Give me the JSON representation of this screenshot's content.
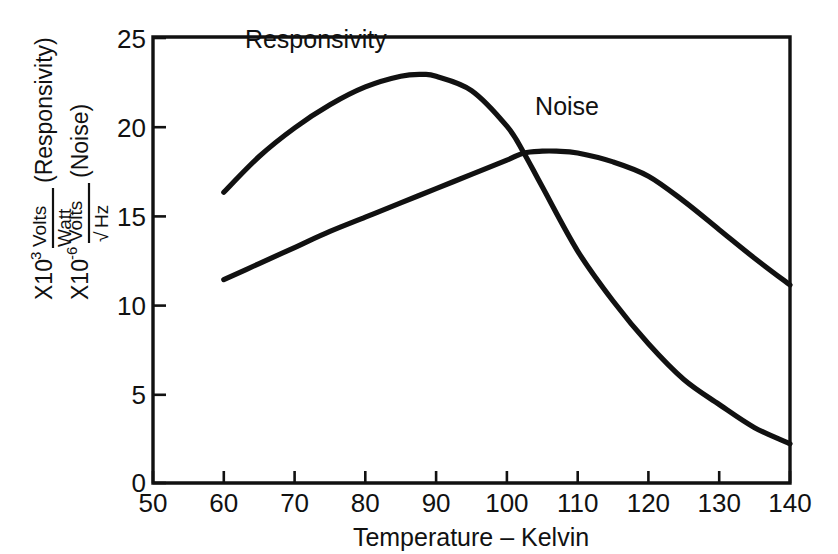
{
  "chart_data": {
    "type": "line",
    "title": "",
    "xlabel": "Temperature – Kelvin",
    "ylabel_line1": "X10³ Volts/Watt (Responsivity)",
    "ylabel_line2": "X10⁻⁶ Volts/√Hz (Noise)",
    "xlim": [
      50,
      140
    ],
    "ylim": [
      0,
      25
    ],
    "xticks": [
      50,
      60,
      70,
      80,
      90,
      100,
      110,
      120,
      130,
      140
    ],
    "yticks": [
      0,
      5,
      10,
      15,
      20,
      25
    ],
    "grid": false,
    "legend_position": "inline-annotations",
    "series": [
      {
        "name": "Responsivity",
        "units": "X10^3 Volts/Watt",
        "x": [
          60,
          65,
          70,
          75,
          80,
          85,
          88,
          90,
          95,
          100,
          102.4,
          105,
          110,
          115,
          120,
          125,
          130,
          135,
          140
        ],
        "values": [
          16.3,
          18.3,
          19.9,
          21.2,
          22.2,
          22.8,
          22.9,
          22.8,
          22.0,
          20.0,
          18.5,
          16.6,
          13.0,
          10.2,
          7.8,
          5.8,
          4.4,
          3.1,
          2.2
        ]
      },
      {
        "name": "Noise",
        "units": "X10^-6 Volts/√Hz",
        "x": [
          60,
          65,
          70,
          75,
          80,
          85,
          90,
          95,
          100,
          102.4,
          105,
          107,
          110,
          115,
          120,
          125,
          130,
          135,
          140
        ],
        "values": [
          11.4,
          12.3,
          13.2,
          14.1,
          14.9,
          15.7,
          16.5,
          17.3,
          18.1,
          18.5,
          18.6,
          18.6,
          18.5,
          18.0,
          17.2,
          15.8,
          14.2,
          12.6,
          11.1
        ]
      }
    ],
    "annotations": [
      {
        "text": "Responsivity",
        "x": 73,
        "y": 24.4
      },
      {
        "text": "Noise",
        "x": 108.5,
        "y": 20.6
      }
    ],
    "ylabel_parts": {
      "prefix1": "X10",
      "exp1": "3",
      "num1": "Volts",
      "den1": "Watt",
      "paren1": "(Responsivity)",
      "prefix2": "X10",
      "exp2": "-6",
      "num2": "Volts",
      "den2_radical": "√",
      "den2": "Hz",
      "paren2": "(Noise)"
    }
  },
  "colors": {
    "ink": "#111111",
    "background": "#ffffff"
  }
}
